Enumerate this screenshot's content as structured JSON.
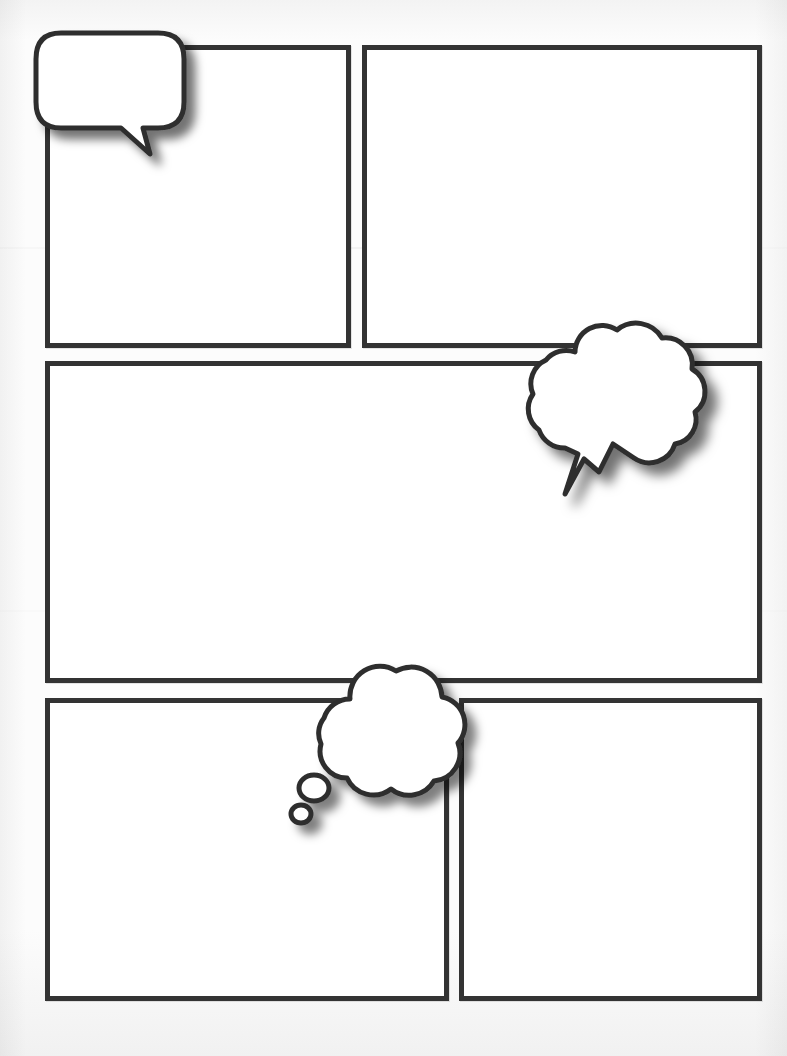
{
  "document": {
    "title": "Blank Comic Book Page Template",
    "kind": "comic-page",
    "page_width": 787,
    "page_height": 1056,
    "background_color": "#fbfbfb",
    "ink_color": "#333333",
    "panel_fill": "#ffffff",
    "shadow_color": "rgba(0,0,0,0.45)"
  },
  "panels": [
    {
      "id": "panel-1",
      "name": "top-left-panel",
      "row": 1,
      "position": 1,
      "x": 45,
      "y": 45,
      "width": 306,
      "height": 303,
      "content": ""
    },
    {
      "id": "panel-2",
      "name": "top-right-panel",
      "row": 1,
      "position": 2,
      "x": 362,
      "y": 45,
      "width": 400,
      "height": 303,
      "content": ""
    },
    {
      "id": "panel-3",
      "name": "middle-wide-panel",
      "row": 2,
      "position": 1,
      "x": 45,
      "y": 361,
      "width": 717,
      "height": 322,
      "content": ""
    },
    {
      "id": "panel-4",
      "name": "bottom-left-panel",
      "row": 3,
      "position": 1,
      "x": 45,
      "y": 698,
      "width": 404,
      "height": 303,
      "content": ""
    },
    {
      "id": "panel-5",
      "name": "bottom-right-panel",
      "row": 3,
      "position": 2,
      "x": 459,
      "y": 698,
      "width": 303,
      "height": 303,
      "content": ""
    }
  ],
  "balloons": [
    {
      "id": "balloon-1",
      "name": "speech-balloon",
      "type": "speech",
      "shape": "rounded-rectangle",
      "tail": "pointed-tail-down-right",
      "x": 33,
      "y": 30,
      "width": 153,
      "height": 120,
      "text": "",
      "attached_panel": "panel-1"
    },
    {
      "id": "balloon-2",
      "name": "shout-balloon",
      "type": "shout",
      "shape": "cloud-burst",
      "tail": "lightning-bolt",
      "x": 503,
      "y": 308,
      "width": 196,
      "height": 185,
      "text": "",
      "attached_panel": "panel-3"
    },
    {
      "id": "balloon-3",
      "name": "thought-balloon",
      "type": "thought",
      "shape": "cloud",
      "tail": "two-trailing-bubbles",
      "x": 288,
      "y": 648,
      "width": 175,
      "height": 155,
      "text": "",
      "attached_panel": "panel-4",
      "trailing_dots": 2
    }
  ],
  "layout": {
    "rows": 3,
    "panel_count": 5,
    "balloon_count": 3,
    "gutter_horizontal": 11,
    "gutter_vertical": 14
  }
}
